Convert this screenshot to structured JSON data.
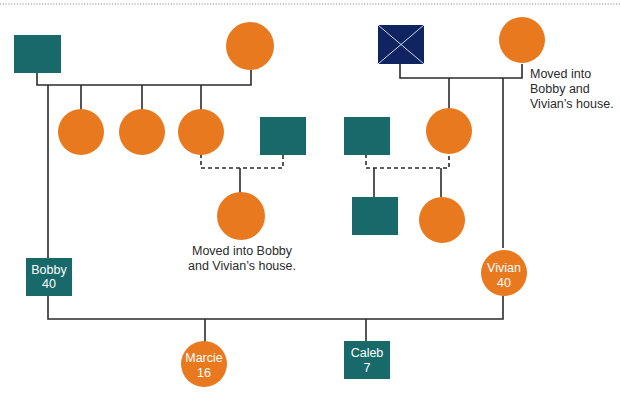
{
  "diagram": {
    "type": "genogram",
    "colors": {
      "male": "#17696a",
      "female": "#e8791f",
      "deceased_male": "#0f2460",
      "line": "#2b2b2b",
      "top_rule": "#7a7a7a"
    },
    "people": {
      "paternal_grandfather": {
        "sex": "male",
        "label": ""
      },
      "paternal_grandmother": {
        "sex": "female",
        "label": ""
      },
      "paternal_aunt_1": {
        "sex": "female",
        "label": ""
      },
      "paternal_aunt_2": {
        "sex": "female",
        "label": ""
      },
      "paternal_aunt_3": {
        "sex": "female",
        "label": ""
      },
      "paternal_aunt_3_partner": {
        "sex": "male",
        "label": ""
      },
      "paternal_cousin": {
        "sex": "female",
        "label": ""
      },
      "maternal_grandfather": {
        "sex": "male",
        "status": "deceased",
        "label": ""
      },
      "maternal_grandmother": {
        "sex": "female",
        "label": ""
      },
      "maternal_aunt_partner": {
        "sex": "male",
        "label": ""
      },
      "maternal_aunt": {
        "sex": "female",
        "label": ""
      },
      "maternal_cousin_male": {
        "sex": "male",
        "label": ""
      },
      "maternal_cousin_female": {
        "sex": "female",
        "label": ""
      },
      "bobby": {
        "sex": "male",
        "name": "Bobby",
        "age": "40"
      },
      "vivian": {
        "sex": "female",
        "name": "Vivian",
        "age": "40"
      },
      "marcie": {
        "sex": "female",
        "name": "Marcie",
        "age": "16"
      },
      "caleb": {
        "sex": "male",
        "name": "Caleb",
        "age": "7"
      }
    },
    "notes": {
      "cousin_note_line1": "Moved into Bobby",
      "cousin_note_line2": "and Vivian’s house.",
      "grandmother_note_line1": "Moved into",
      "grandmother_note_line2": "Bobby and",
      "grandmother_note_line3": "Vivian’s house."
    }
  }
}
